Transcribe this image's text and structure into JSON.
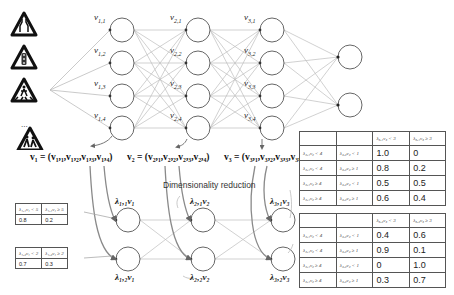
{
  "figure": {
    "inputs": {
      "signs": [
        "road-narrows-sign",
        "traffic-light-sign",
        "pedestrian-crossing-sign",
        "children-crossing-sign"
      ],
      "ellipsis": "..."
    },
    "layers": [
      {
        "nodes": [
          "v1,1",
          "v1,2",
          "v1,3",
          "v1,4"
        ],
        "labels": [
          {
            "base": "v",
            "sub": "1,1"
          },
          {
            "base": "v",
            "sub": "1,2"
          },
          {
            "base": "v",
            "sub": "1,3"
          },
          {
            "base": "v",
            "sub": "1,4"
          }
        ]
      },
      {
        "nodes": [
          "v2,1",
          "v2,2",
          "v2,3",
          "v2,4"
        ],
        "labels": [
          {
            "base": "v",
            "sub": "2,1"
          },
          {
            "base": "v",
            "sub": "2,2"
          },
          {
            "base": "v",
            "sub": "2,3"
          },
          {
            "base": "v",
            "sub": "2,4"
          }
        ]
      },
      {
        "nodes": [
          "v3,1",
          "v3,2",
          "v3,3",
          "v3,4"
        ],
        "labels": [
          {
            "base": "v",
            "sub": "3,1"
          },
          {
            "base": "v",
            "sub": "3,2"
          },
          {
            "base": "v",
            "sub": "3,3"
          },
          {
            "base": "v",
            "sub": "3,4"
          }
        ]
      }
    ],
    "output_nodes": 2,
    "equations": [
      "v₁ = (v₁,₁,v₁,₂,v₁,₃,v₁,₄)",
      "v₂ = (v₂,₁,v₂,₂,v₂,₃,v₂,₄)",
      "v₃ = (v₃,₁,v₃,₂,v₃,₃,v₃,₄)"
    ],
    "reduction_label": "Dimensionality reduction",
    "reduced_nodes": [
      {
        "top": "λ₁,₁v₁",
        "bottom": "λ₁,₂v₁"
      },
      {
        "top": "λ₂,₁v₂",
        "bottom": "λ₂,₂v₂"
      },
      {
        "top": "λ₃,₁v₃",
        "bottom": "λ₃,₂v₃"
      }
    ],
    "left_tables": [
      {
        "headers": [
          "λ₁,₁v₁ < 5",
          "λ₁,₁v₁ ≥ 5"
        ],
        "values": [
          "0.8",
          "0.2"
        ]
      },
      {
        "headers": [
          "λ₁,₂v₁ < 2",
          "λ₁,₂v₁ ≥ 2"
        ],
        "values": [
          "0.7",
          "0.3"
        ]
      }
    ],
    "right_tables": [
      {
        "headers": [
          "",
          "",
          "λ₃,₁v₃ < 3",
          "λ₃,₁v₃ ≥ 3"
        ],
        "rows": [
          [
            "λ₂,₁v₂ < 4",
            "λ₂,₂v₂ < 1",
            "1.0",
            "0"
          ],
          [
            "λ₂,₁v₂ < 4",
            "λ₂,₂v₂ ≥ 1",
            "0.8",
            "0.2"
          ],
          [
            "λ₂,₁v₂ ≥ 4",
            "λ₂,₂v₂ < 1",
            "0.5",
            "0.5"
          ],
          [
            "λ₂,₁v₂ ≥ 4",
            "λ₂,₂v₂ ≥ 1",
            "0.6",
            "0.4"
          ]
        ]
      },
      {
        "headers": [
          "",
          "",
          "λ₃,₂v₃ < 3",
          "λ₃,₂v₃ ≥ 3"
        ],
        "rows": [
          [
            "λ₂,₁v₂ < 4",
            "λ₂,₂v₂ < 1",
            "0.4",
            "0.6"
          ],
          [
            "λ₂,₁v₂ < 4",
            "λ₂,₂v₂ ≥ 1",
            "0.9",
            "0.1"
          ],
          [
            "λ₂,₁v₂ ≥ 4",
            "λ₂,₂v₂ < 1",
            "0",
            "1.0"
          ],
          [
            "λ₂,₁v₂ ≥ 4",
            "λ₂,₂v₂ ≥ 1",
            "0.3",
            "0.7"
          ]
        ]
      }
    ]
  }
}
